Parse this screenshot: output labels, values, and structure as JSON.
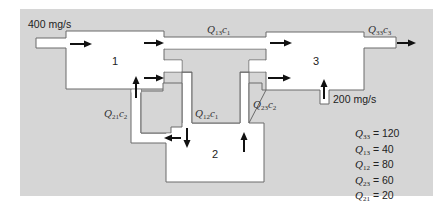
{
  "diagram": {
    "background_color": "#d6d6d6",
    "vessel_fill": "#ffffff",
    "vessel_stroke": "#666666",
    "arrow_color": "#111111",
    "reactors": [
      {
        "id": "1",
        "label": "1"
      },
      {
        "id": "2",
        "label": "2"
      },
      {
        "id": "3",
        "label": "3"
      }
    ],
    "inputs": [
      {
        "label": "400 mg/s",
        "into": "1"
      },
      {
        "label": "200 mg/s",
        "into": "3"
      }
    ],
    "flows": [
      {
        "symbol": "Q",
        "sub": "13",
        "conc": "c",
        "csub": "1",
        "from": "1",
        "to": "3"
      },
      {
        "symbol": "Q",
        "sub": "33",
        "conc": "c",
        "csub": "3",
        "from": "3",
        "to": "out"
      },
      {
        "symbol": "Q",
        "sub": "12",
        "conc": "c",
        "csub": "1",
        "from": "1",
        "to": "2"
      },
      {
        "symbol": "Q",
        "sub": "21",
        "conc": "c",
        "csub": "2",
        "from": "2",
        "to": "1"
      },
      {
        "symbol": "Q",
        "sub": "23",
        "conc": "c",
        "csub": "2",
        "from": "2",
        "to": "3"
      }
    ],
    "legend": [
      {
        "symbol": "Q",
        "sub": "33",
        "value": "= 120"
      },
      {
        "symbol": "Q",
        "sub": "13",
        "value": "= 40"
      },
      {
        "symbol": "Q",
        "sub": "12",
        "value": "= 80"
      },
      {
        "symbol": "Q",
        "sub": "23",
        "value": "= 60"
      },
      {
        "symbol": "Q",
        "sub": "21",
        "value": "= 20"
      }
    ]
  }
}
